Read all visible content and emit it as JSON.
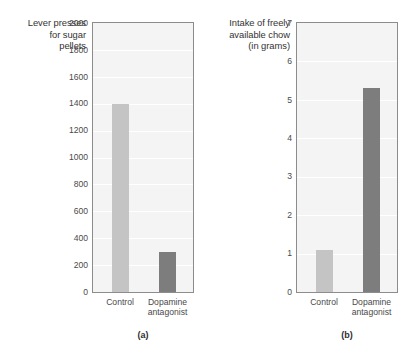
{
  "figure": {
    "width": 408,
    "height": 352,
    "background": "#ffffff"
  },
  "chart_data": [
    {
      "type": "bar",
      "panel": "(a)",
      "title": "",
      "xlabel": "",
      "ylabel": "Lever presses for sugar pellets",
      "ylabel_lines": [
        "Lever presses",
        "for sugar",
        "pellets"
      ],
      "categories": [
        "Control",
        "Dopamine antagonist"
      ],
      "category_lines": [
        [
          "Control"
        ],
        [
          "Dopamine",
          "antagonist"
        ]
      ],
      "values": [
        1400,
        300
      ],
      "ylim": [
        0,
        2000
      ],
      "yticks": [
        0,
        200,
        400,
        600,
        800,
        1000,
        1200,
        1400,
        1600,
        1800,
        2000
      ],
      "ytick_labels": [
        "0",
        "200",
        "400",
        "600",
        "800",
        "1000",
        "1200",
        "1400",
        "1600",
        "1800",
        "2000"
      ],
      "grid": true,
      "legend": "none",
      "bar_colors": [
        "#c4c4c4",
        "#7d7d7d"
      ],
      "plot_background": "#f4f4f4",
      "gridline_color": "#ffffff",
      "axis_color": "#8c8c8c"
    },
    {
      "type": "bar",
      "panel": "(b)",
      "title": "",
      "xlabel": "",
      "ylabel": "Intake of freely available chow (in grams)",
      "ylabel_lines": [
        "Intake of freely",
        "available chow",
        "(in grams)"
      ],
      "categories": [
        "Control",
        "Dopamine antagonist"
      ],
      "category_lines": [
        [
          "Control"
        ],
        [
          "Dopamine",
          "antagonist"
        ]
      ],
      "values": [
        1.1,
        5.3
      ],
      "ylim": [
        0,
        7
      ],
      "yticks": [
        0,
        1,
        2,
        3,
        4,
        5,
        6,
        7
      ],
      "ytick_labels": [
        "0",
        "1",
        "2",
        "3",
        "4",
        "5",
        "6",
        "7"
      ],
      "grid": true,
      "legend": "none",
      "bar_colors": [
        "#c4c4c4",
        "#7d7d7d"
      ],
      "plot_background": "#f4f4f4",
      "gridline_color": "#ffffff",
      "axis_color": "#8c8c8c"
    }
  ]
}
